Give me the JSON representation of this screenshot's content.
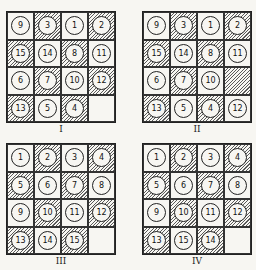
{
  "figure": {
    "panels": [
      {
        "label": "I",
        "cells": [
          {
            "n": "9",
            "shaded": false
          },
          {
            "n": "3",
            "shaded": true
          },
          {
            "n": "1",
            "shaded": false
          },
          {
            "n": "2",
            "shaded": true
          },
          {
            "n": "15",
            "shaded": true
          },
          {
            "n": "14",
            "shaded": false
          },
          {
            "n": "8",
            "shaded": true
          },
          {
            "n": "11",
            "shaded": false
          },
          {
            "n": "6",
            "shaded": false
          },
          {
            "n": "7",
            "shaded": true
          },
          {
            "n": "10",
            "shaded": false
          },
          {
            "n": "12",
            "shaded": true
          },
          {
            "n": "13",
            "shaded": true
          },
          {
            "n": "5",
            "shaded": false
          },
          {
            "n": "4",
            "shaded": true
          },
          {
            "n": "",
            "shaded": false
          }
        ]
      },
      {
        "label": "II",
        "cells": [
          {
            "n": "9",
            "shaded": false
          },
          {
            "n": "3",
            "shaded": true
          },
          {
            "n": "1",
            "shaded": false
          },
          {
            "n": "2",
            "shaded": true
          },
          {
            "n": "15",
            "shaded": true
          },
          {
            "n": "14",
            "shaded": false
          },
          {
            "n": "8",
            "shaded": true
          },
          {
            "n": "11",
            "shaded": false
          },
          {
            "n": "6",
            "shaded": false
          },
          {
            "n": "7",
            "shaded": true
          },
          {
            "n": "10",
            "shaded": false
          },
          {
            "n": "",
            "shaded": true
          },
          {
            "n": "13",
            "shaded": true
          },
          {
            "n": "5",
            "shaded": false
          },
          {
            "n": "4",
            "shaded": true
          },
          {
            "n": "12",
            "shaded": false
          }
        ]
      },
      {
        "label": "III",
        "cells": [
          {
            "n": "1",
            "shaded": false
          },
          {
            "n": "2",
            "shaded": true
          },
          {
            "n": "3",
            "shaded": false
          },
          {
            "n": "4",
            "shaded": true
          },
          {
            "n": "5",
            "shaded": true
          },
          {
            "n": "6",
            "shaded": false
          },
          {
            "n": "7",
            "shaded": true
          },
          {
            "n": "8",
            "shaded": false
          },
          {
            "n": "9",
            "shaded": false
          },
          {
            "n": "10",
            "shaded": true
          },
          {
            "n": "11",
            "shaded": false
          },
          {
            "n": "12",
            "shaded": true
          },
          {
            "n": "13",
            "shaded": true
          },
          {
            "n": "14",
            "shaded": false
          },
          {
            "n": "15",
            "shaded": true
          },
          {
            "n": "",
            "shaded": false
          }
        ]
      },
      {
        "label": "IV",
        "cells": [
          {
            "n": "1",
            "shaded": false
          },
          {
            "n": "2",
            "shaded": true
          },
          {
            "n": "3",
            "shaded": false
          },
          {
            "n": "4",
            "shaded": true
          },
          {
            "n": "5",
            "shaded": true
          },
          {
            "n": "6",
            "shaded": false
          },
          {
            "n": "7",
            "shaded": true
          },
          {
            "n": "8",
            "shaded": false
          },
          {
            "n": "9",
            "shaded": false
          },
          {
            "n": "10",
            "shaded": true
          },
          {
            "n": "11",
            "shaded": false
          },
          {
            "n": "12",
            "shaded": true
          },
          {
            "n": "13",
            "shaded": true
          },
          {
            "n": "15",
            "shaded": false
          },
          {
            "n": "14",
            "shaded": true
          },
          {
            "n": "",
            "shaded": false
          }
        ]
      }
    ]
  }
}
